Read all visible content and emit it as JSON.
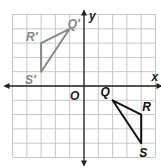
{
  "diagram": {
    "type": "coordinate-plane",
    "grid": {
      "xmin": -5,
      "xmax": 5,
      "ymin": -5,
      "ymax": 5,
      "step": 1
    },
    "axes": {
      "x_label": "x",
      "y_label": "y",
      "origin_label": "O"
    },
    "colors": {
      "grid": "#c8c8c8",
      "axis": "#222222",
      "image": "#888888",
      "preimage": "#111111"
    },
    "triangles": [
      {
        "name": "preimage",
        "vertices": [
          {
            "label": "Q",
            "x": 2,
            "y": -1
          },
          {
            "label": "R",
            "x": 4,
            "y": -2
          },
          {
            "label": "S",
            "x": 4,
            "y": -4
          }
        ]
      },
      {
        "name": "image",
        "vertices": [
          {
            "label": "Q′",
            "x": -1,
            "y": 4
          },
          {
            "label": "R′",
            "x": -3,
            "y": 3
          },
          {
            "label": "S′",
            "x": -3,
            "y": 1
          }
        ]
      }
    ]
  }
}
